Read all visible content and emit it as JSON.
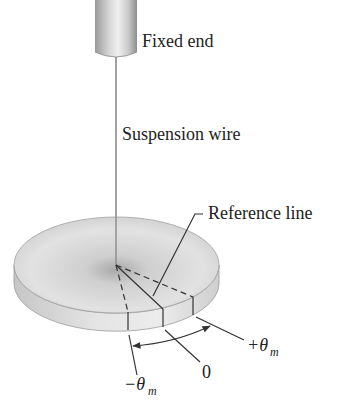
{
  "figure": {
    "labels": {
      "fixed_end": "Fixed end",
      "suspension_wire": "Suspension wire",
      "reference_line": "Reference line",
      "plus_theta": "+θ",
      "plus_theta_sub": "m",
      "zero": "0",
      "minus_theta": "−θ",
      "minus_theta_sub": "m"
    },
    "colors": {
      "line": "#333333",
      "disk_light": "#e6e6e6",
      "disk_mid": "#c4c4c4",
      "disk_dark": "#a8a8a8",
      "text": "#222222"
    }
  }
}
